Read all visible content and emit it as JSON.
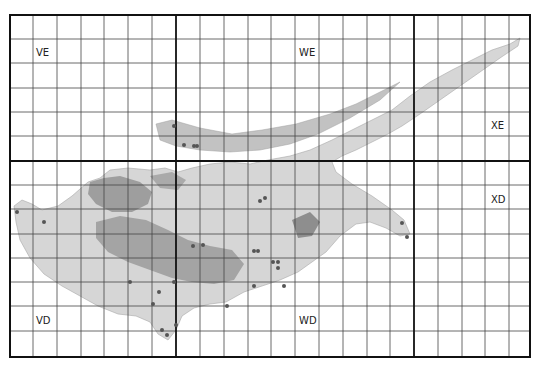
{
  "map": {
    "frame": {
      "x0": 10,
      "y0": 15,
      "x1": 530,
      "y1": 357
    },
    "major_x": [
      176,
      414
    ],
    "major_y": [
      161
    ],
    "minor_x": [
      33,
      57,
      81,
      104,
      128,
      152,
      200,
      224,
      248,
      271,
      295,
      319,
      343,
      367,
      390,
      438,
      462,
      485,
      509
    ],
    "minor_y": [
      39,
      63,
      88,
      112,
      136,
      185,
      209,
      234,
      258,
      282,
      306,
      331
    ],
    "squares": [
      {
        "code": "VE",
        "x": 36,
        "y": 56
      },
      {
        "code": "WE",
        "x": 299,
        "y": 56
      },
      {
        "code": "XE",
        "x": 491,
        "y": 129
      },
      {
        "code": "VD",
        "x": 36,
        "y": 324
      },
      {
        "code": "WD",
        "x": 299,
        "y": 324
      },
      {
        "code": "XD",
        "x": 491,
        "y": 203
      }
    ],
    "records": [
      [
        174,
        126
      ],
      [
        184,
        145
      ],
      [
        194,
        146
      ],
      [
        197,
        146
      ],
      [
        44,
        222
      ],
      [
        17,
        212
      ],
      [
        260,
        201
      ],
      [
        265,
        198
      ],
      [
        402,
        223
      ],
      [
        407,
        237
      ],
      [
        254,
        251
      ],
      [
        258,
        251
      ],
      [
        273,
        262
      ],
      [
        278,
        262
      ],
      [
        278,
        268
      ],
      [
        130,
        282
      ],
      [
        174,
        282
      ],
      [
        159,
        292
      ],
      [
        153,
        304
      ],
      [
        193,
        246
      ],
      [
        203,
        245
      ],
      [
        284,
        286
      ],
      [
        227,
        306
      ],
      [
        254,
        286
      ],
      [
        176,
        325
      ],
      [
        162,
        330
      ],
      [
        167,
        335
      ]
    ],
    "colors": {
      "grid": "#333333",
      "major": "#111111",
      "land": "#bdbdbd",
      "land_dark": "#8c8c8c",
      "dot": "#555555"
    }
  }
}
